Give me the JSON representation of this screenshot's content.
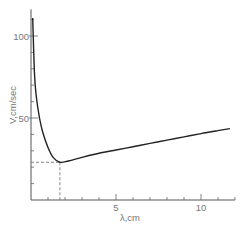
{
  "chart_data": {
    "type": "line",
    "title": "",
    "xlabel": "λ,cm",
    "ylabel": "V,cm/sec",
    "xlim": [
      0,
      12
    ],
    "ylim": [
      0,
      115
    ],
    "x_ticks": [
      {
        "value": 5,
        "label": "5"
      },
      {
        "value": 10,
        "label": "10"
      }
    ],
    "x_minor_step": 1,
    "y_ticks": [
      {
        "value": 50,
        "label": "50"
      },
      {
        "value": 100,
        "label": "100"
      }
    ],
    "y_minor_step": 10,
    "grid": false,
    "series": [
      {
        "name": "wave phase speed",
        "x": [
          0.1,
          0.2,
          0.3,
          0.5,
          0.7,
          1.0,
          1.3,
          1.7,
          2.2,
          3,
          4,
          5,
          6,
          7,
          8,
          9,
          10,
          11,
          11.7
        ],
        "y": [
          111,
          78,
          64,
          50,
          41,
          32,
          26,
          23,
          23.8,
          26,
          28.5,
          30.5,
          32.5,
          34.5,
          36.5,
          38.5,
          40.5,
          42.3,
          43.5
        ]
      }
    ],
    "annotations": [
      {
        "type": "dashed-guide",
        "x": 1.7,
        "y": 23,
        "description": "minimum velocity"
      }
    ]
  }
}
